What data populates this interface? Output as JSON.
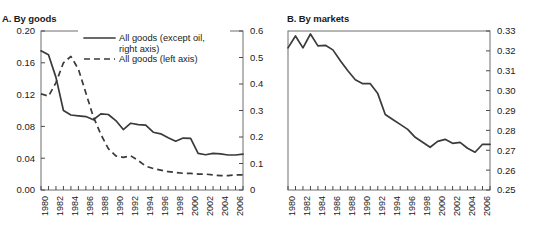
{
  "figure": {
    "panels": [
      {
        "id": "A",
        "title": "A. By goods"
      },
      {
        "id": "B",
        "title": "B. By markets"
      }
    ]
  },
  "panel_a": {
    "title": "A. By goods",
    "legend": [
      {
        "label_line1": "All goods (except oil,",
        "label_line2": "right axis)",
        "style": "solid"
      },
      {
        "label_line1": "All goods (left axis)",
        "label_line2": "",
        "style": "dashed"
      }
    ],
    "left_axis_ticks": [
      "0.00",
      "0.04",
      "0.08",
      "0.12",
      "0.16",
      "0.20"
    ],
    "right_axis_ticks": [
      "0",
      "0.1",
      "0.2",
      "0.3",
      "0.4",
      "0.5",
      "0.6"
    ],
    "year_ticks": [
      "1980",
      "1982",
      "1984",
      "1986",
      "1988",
      "1990",
      "1992",
      "1994",
      "1996",
      "1998",
      "2000",
      "2002",
      "2004",
      "2006"
    ]
  },
  "panel_b": {
    "title": "B. By markets",
    "right_axis_ticks": [
      "0.25",
      "0.26",
      "0.27",
      "0.28",
      "0.29",
      "0.30",
      "0.31",
      "0.32",
      "0.33"
    ],
    "year_ticks": [
      "1980",
      "1982",
      "1984",
      "1986",
      "1988",
      "1990",
      "1992",
      "1994",
      "1996",
      "1998",
      "2000",
      "2002",
      "2004",
      "2006"
    ]
  },
  "chart_data": [
    {
      "type": "line",
      "id": "panel-a",
      "title": "A. By goods",
      "xlabel": "",
      "ylabel": "",
      "grid": false,
      "legend_position": "top-center",
      "x": [
        1979,
        1980,
        1981,
        1982,
        1983,
        1984,
        1985,
        1986,
        1987,
        1988,
        1989,
        1990,
        1991,
        1992,
        1993,
        1994,
        1995,
        1996,
        1997,
        1998,
        1999,
        2000,
        2001,
        2002,
        2003,
        2004,
        2005,
        2006
      ],
      "y_axis_left": {
        "label": "All goods (left axis)",
        "range": [
          0.0,
          0.2
        ],
        "ticks": [
          0.0,
          0.04,
          0.08,
          0.12,
          0.16,
          0.2
        ]
      },
      "y_axis_right": {
        "label": "All goods (except oil, right axis)",
        "range": [
          0.0,
          0.6
        ],
        "ticks": [
          0.0,
          0.1,
          0.2,
          0.3,
          0.4,
          0.5,
          0.6
        ]
      },
      "series": [
        {
          "name": "All goods (except oil, right axis)",
          "axis": "right",
          "style": "solid",
          "values": [
            0.525,
            0.51,
            0.425,
            0.3,
            0.283,
            0.28,
            0.277,
            0.265,
            0.287,
            0.285,
            0.262,
            0.228,
            0.252,
            0.247,
            0.245,
            0.218,
            0.212,
            0.197,
            0.184,
            0.196,
            0.195,
            0.138,
            0.133,
            0.138,
            0.136,
            0.132,
            0.132,
            0.135
          ]
        },
        {
          "name": "All goods (left axis)",
          "axis": "left",
          "style": "dashed",
          "values": [
            0.121,
            0.118,
            0.135,
            0.16,
            0.168,
            0.152,
            0.122,
            0.092,
            0.07,
            0.052,
            0.043,
            0.041,
            0.043,
            0.037,
            0.03,
            0.027,
            0.025,
            0.023,
            0.022,
            0.021,
            0.021,
            0.02,
            0.02,
            0.019,
            0.018,
            0.018,
            0.019,
            0.019
          ]
        }
      ]
    },
    {
      "type": "line",
      "id": "panel-b",
      "title": "B. By markets",
      "xlabel": "",
      "ylabel": "",
      "grid": false,
      "legend_position": "none",
      "x": [
        1979,
        1980,
        1981,
        1982,
        1983,
        1984,
        1985,
        1986,
        1987,
        1988,
        1989,
        1990,
        1991,
        1992,
        1993,
        1994,
        1995,
        1996,
        1997,
        1998,
        1999,
        2000,
        2001,
        2002,
        2003,
        2004,
        2005,
        2006
      ],
      "y_axis_right": {
        "range": [
          0.25,
          0.33
        ],
        "ticks": [
          0.25,
          0.26,
          0.27,
          0.28,
          0.29,
          0.3,
          0.31,
          0.32,
          0.33
        ]
      },
      "series": [
        {
          "name": "By markets",
          "axis": "right",
          "style": "solid",
          "values": [
            0.3215,
            0.3275,
            0.3215,
            0.3285,
            0.3225,
            0.3228,
            0.3205,
            0.315,
            0.31,
            0.3055,
            0.3035,
            0.3035,
            0.2985,
            0.288,
            0.2855,
            0.283,
            0.2805,
            0.2765,
            0.274,
            0.2715,
            0.2745,
            0.2755,
            0.2735,
            0.274,
            0.271,
            0.269,
            0.273,
            0.273
          ]
        }
      ]
    }
  ]
}
